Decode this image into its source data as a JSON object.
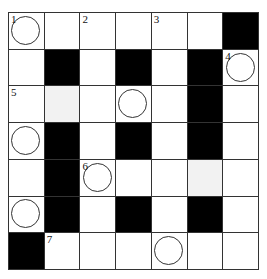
{
  "puzzle": {
    "type": "crossword",
    "rows": 7,
    "cols": 7,
    "colors": {
      "block": "#000000",
      "shaded": "#f2f2f2",
      "cell": "#ffffff",
      "line": "#333333"
    },
    "legend": {
      "B": "black block",
      "W": "white cell",
      "S": "shaded (light gray) cell"
    },
    "grid": [
      [
        "W",
        "W",
        "W",
        "W",
        "W",
        "W",
        "B"
      ],
      [
        "W",
        "B",
        "W",
        "B",
        "W",
        "B",
        "W"
      ],
      [
        "W",
        "S",
        "W",
        "W",
        "W",
        "B",
        "W"
      ],
      [
        "W",
        "B",
        "W",
        "B",
        "W",
        "B",
        "W"
      ],
      [
        "W",
        "B",
        "W",
        "W",
        "W",
        "S",
        "W"
      ],
      [
        "W",
        "B",
        "W",
        "B",
        "W",
        "B",
        "W"
      ],
      [
        "B",
        "W",
        "W",
        "W",
        "W",
        "W",
        "W"
      ]
    ],
    "numbers": [
      {
        "row": 0,
        "col": 0,
        "label": "1"
      },
      {
        "row": 0,
        "col": 2,
        "label": "2"
      },
      {
        "row": 0,
        "col": 4,
        "label": "3"
      },
      {
        "row": 1,
        "col": 6,
        "label": "4"
      },
      {
        "row": 2,
        "col": 0,
        "label": "5"
      },
      {
        "row": 4,
        "col": 2,
        "label": "6"
      },
      {
        "row": 6,
        "col": 1,
        "label": "7"
      }
    ],
    "circles": [
      {
        "row": 0,
        "col": 0
      },
      {
        "row": 1,
        "col": 6
      },
      {
        "row": 2,
        "col": 3
      },
      {
        "row": 3,
        "col": 0
      },
      {
        "row": 4,
        "col": 2
      },
      {
        "row": 5,
        "col": 0
      },
      {
        "row": 6,
        "col": 4
      }
    ]
  }
}
